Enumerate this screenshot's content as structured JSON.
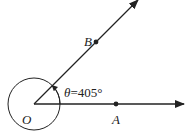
{
  "diagram": {
    "type": "angle-diagram",
    "points": {
      "origin": "O",
      "point_on_initial_side": "A",
      "point_on_terminal_side": "B"
    },
    "angle_label_symbol": "θ",
    "angle_label_value": "=405°",
    "angle_degrees": 405,
    "colors": {
      "stroke": "#222222",
      "background": "#ffffff"
    }
  }
}
